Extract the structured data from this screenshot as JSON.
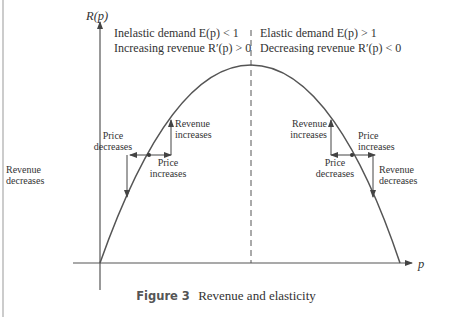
{
  "figure": {
    "caption_label": "Figure 3",
    "caption_text": "Revenue and elasticity",
    "y_axis_label": "R(p)",
    "x_axis_label": "p",
    "left_region": {
      "line1": "Inelastic demand E(p) < 1",
      "line2": "Increasing revenue R′(p) > 0"
    },
    "right_region": {
      "line1": "Elastic demand E(p) > 1",
      "line2": "Decreasing revenue R′(p) < 0"
    },
    "left_annotations": {
      "price_decreases": [
        "Price",
        "decreases"
      ],
      "revenue_increases": [
        "Revenue",
        "increases"
      ],
      "price_increases": [
        "Price",
        "increases"
      ],
      "revenue_decreases": [
        "Revenue",
        "decreases"
      ]
    },
    "right_annotations": {
      "revenue_increases": [
        "Revenue",
        "increases"
      ],
      "price_increases": [
        "Price",
        "increases"
      ],
      "price_decreases": [
        "Price",
        "decreases"
      ],
      "revenue_decreases": [
        "Revenue",
        "decreases"
      ]
    }
  },
  "colors": {
    "curve": "#555555",
    "axes": "#555555",
    "text": "#333333"
  }
}
